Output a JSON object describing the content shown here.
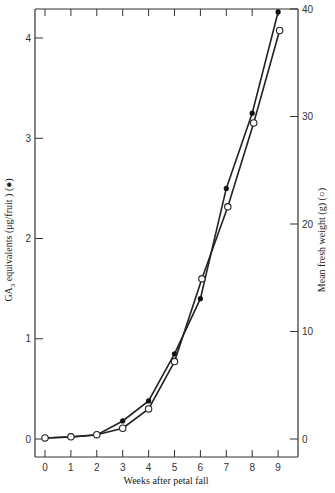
{
  "chart_data": {
    "type": "line",
    "title": "",
    "xlabel": "Weeks after petal fall",
    "ylabel": "GA₃ equivalents (μg/fruit ) (●)",
    "y2label": "Mean fresh weight (g) (○)",
    "x": [
      0,
      1,
      2,
      3,
      4,
      5,
      6,
      7,
      8,
      9
    ],
    "xticks": [
      "0",
      "1",
      "2",
      "3",
      "4",
      "5",
      "6",
      "7",
      "8",
      "9"
    ],
    "yticks": [
      "0",
      "1",
      "2",
      "3",
      "4"
    ],
    "y2ticks": [
      "0",
      "10",
      "20",
      "30",
      "40"
    ],
    "ylim": [
      0,
      4
    ],
    "y2lim": [
      0,
      40
    ],
    "grid": false,
    "legend": "none (markers described in axis labels)",
    "series": [
      {
        "name": "GA3 equivalents (μg/fruit)",
        "marker": "filled-circle",
        "axis": "left",
        "values": [
          0.01,
          0.02,
          0.04,
          0.18,
          0.38,
          0.85,
          1.4,
          2.5,
          3.25,
          4.26
        ]
      },
      {
        "name": "Mean fresh weight (g)",
        "marker": "open-circle",
        "axis": "right",
        "values": [
          0.1,
          0.2,
          0.4,
          1.0,
          2.8,
          7.2,
          14.9,
          21.6,
          29.4,
          38.0
        ]
      }
    ]
  },
  "labels": {
    "xlabel": "Weeks after petal fall",
    "ylabel_main": "GA",
    "ylabel_sub": "3",
    "ylabel_rest": " equivalents (μg/fruit ) (●)",
    "y2label": "Mean fresh weight (g) (○)"
  }
}
